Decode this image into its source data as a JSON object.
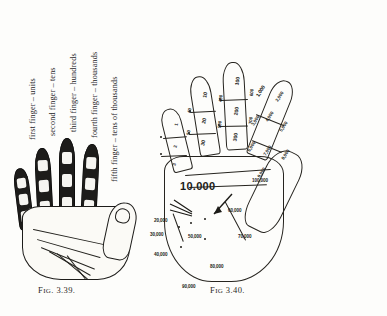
{
  "page": {
    "background": "#fdfdfb",
    "ink": "#1c1b17"
  },
  "figures": [
    {
      "id": "fig-3-39",
      "caption": "FIG. 3.39.",
      "caption_prefix": "F",
      "caption_smallcaps": "IG",
      "caption_rest": ". 3.39.",
      "description": "shaded hand with segmented fingers",
      "labels": [
        {
          "key": "first",
          "text": "first finger – units"
        },
        {
          "key": "second",
          "text": "second finger – tens"
        },
        {
          "key": "third",
          "text": "third finger – hundreds"
        },
        {
          "key": "fourth",
          "text": "fourth finger – thousands"
        },
        {
          "key": "fifth",
          "text": "fifth finger – tens of thousands"
        }
      ]
    },
    {
      "id": "fig-3-40",
      "caption": "FIG 3.40.",
      "caption_prefix": "F",
      "caption_smallcaps": "IG",
      "caption_rest": " 3.40.",
      "description": "outline hand annotated with place-value numerals",
      "fingers": [
        {
          "name": "index-finger",
          "place": "units",
          "values": [
            "1",
            "2",
            "3",
            "4",
            "5",
            "6",
            "7",
            "8",
            "9"
          ]
        },
        {
          "name": "middle-finger",
          "place": "tens",
          "values": [
            "10",
            "20",
            "30",
            "40",
            "50",
            "60",
            "70",
            "80",
            "90"
          ]
        },
        {
          "name": "ring-finger",
          "place": "hundreds",
          "values": [
            "100",
            "200",
            "300",
            "400",
            "500",
            "600",
            "700",
            "800",
            "900"
          ]
        },
        {
          "name": "little-finger",
          "place": "thousands",
          "values": [
            "1,000",
            "2,000",
            "3,000",
            "4,000",
            "5,000",
            "6,000",
            "7,000",
            "8,000",
            "9,000"
          ]
        }
      ],
      "palm_values": [
        {
          "label": "10.000",
          "emphasis": "large"
        },
        {
          "label": "20,000",
          "emphasis": "normal"
        },
        {
          "label": "30,000",
          "emphasis": "normal"
        },
        {
          "label": "40,000",
          "emphasis": "normal"
        },
        {
          "label": "50,000",
          "emphasis": "normal"
        },
        {
          "label": "60,000",
          "emphasis": "normal"
        },
        {
          "label": "70,000",
          "emphasis": "normal"
        },
        {
          "label": "80,000",
          "emphasis": "normal"
        },
        {
          "label": "90,000",
          "emphasis": "normal"
        },
        {
          "label": "100,000",
          "emphasis": "normal"
        }
      ]
    }
  ],
  "fig40_marks": {
    "index": [
      "1",
      "2",
      "3",
      "4",
      "5",
      "6",
      "7",
      "8",
      "9"
    ],
    "middle": [
      "10",
      "20",
      "30",
      "40",
      "50",
      "60",
      "70",
      "80",
      "90"
    ],
    "ring": [
      "100",
      "200",
      "300",
      "400",
      "500",
      "600",
      "700",
      "800",
      "900"
    ],
    "little": [
      "1,000",
      "2,000",
      "3,000",
      "4,000",
      "5,000",
      "6,000",
      "7,000",
      "8,000",
      "9,000"
    ],
    "palm": [
      "10.000",
      "20,000",
      "30,000",
      "40,000",
      "50,000",
      "60,000",
      "70,000",
      "80,000",
      "90,000",
      "100,000"
    ]
  }
}
